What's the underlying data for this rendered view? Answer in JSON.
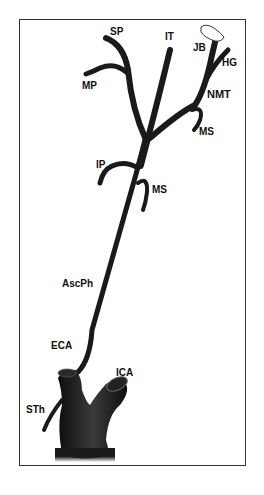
{
  "figure": {
    "labels": {
      "SP": "SP",
      "IT": "IT",
      "JB": "JB",
      "HG": "HG",
      "MP": "MP",
      "NMT": "NMT",
      "MS_upper": "MS",
      "IP": "IP",
      "MS_lower": "MS",
      "AscPh": "AscPh",
      "ECA": "ECA",
      "ICA": "ICA",
      "STh": "STh"
    },
    "colors": {
      "vessel": "#1a1a1a",
      "frame": "#333333",
      "background": "#ffffff"
    }
  }
}
